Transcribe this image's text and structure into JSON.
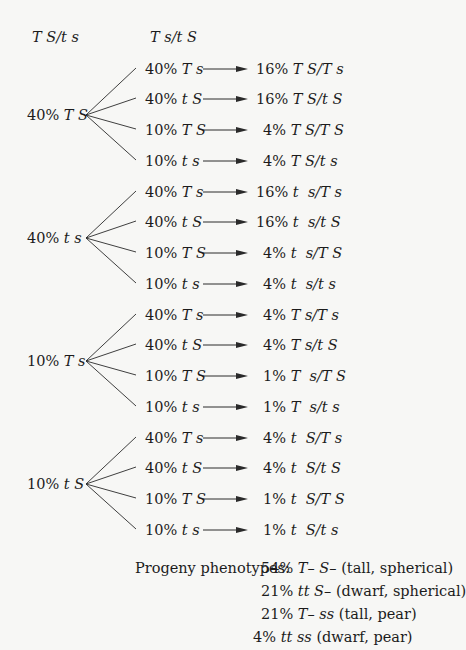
{
  "headers": {
    "parent1": "T S/t s",
    "parent2": "T s/t S"
  },
  "groups": [
    {
      "parent_gamete": "40% T S",
      "parent_y": 115,
      "rows": [
        {
          "gamete": "40% T s",
          "progeny": "16% T S/T s",
          "y": 69
        },
        {
          "gamete": "40% t S",
          "progeny": "16% T S/t S",
          "y": 99
        },
        {
          "gamete": "10% T S",
          "progeny": "4% T S/T S",
          "y": 130
        },
        {
          "gamete": "10% t s",
          "progeny": "4% T S/t s",
          "y": 161
        }
      ]
    },
    {
      "parent_gamete": "40% t s",
      "parent_y": 238,
      "rows": [
        {
          "gamete": "40% T s",
          "progeny": "16% t  s/T s",
          "y": 192
        },
        {
          "gamete": "40% t S",
          "progeny": "16% t  s/t S",
          "y": 222
        },
        {
          "gamete": "10% T S",
          "progeny": "4% t  s/T S",
          "y": 253
        },
        {
          "gamete": "10% t s",
          "progeny": "4% t  s/t s",
          "y": 284
        }
      ]
    },
    {
      "parent_gamete": "10% T s",
      "parent_y": 361,
      "rows": [
        {
          "gamete": "40% T s",
          "progeny": "4% T s/T s",
          "y": 315
        },
        {
          "gamete": "40% t S",
          "progeny": "4% T s/t S",
          "y": 345
        },
        {
          "gamete": "10% T S",
          "progeny": "1% T  s/T S",
          "y": 376
        },
        {
          "gamete": "10% t s",
          "progeny": "1% T  s/t s",
          "y": 407
        }
      ]
    },
    {
      "parent_gamete": "10% t S",
      "parent_y": 484,
      "rows": [
        {
          "gamete": "40% T s",
          "progeny": "4% t  S/T s",
          "y": 438
        },
        {
          "gamete": "40% t S",
          "progeny": "4% t  S/t S",
          "y": 468
        },
        {
          "gamete": "10% T S",
          "progeny": "1% t  S/T S",
          "y": 499
        },
        {
          "gamete": "10% t s",
          "progeny": "1% t  S/t s",
          "y": 530
        }
      ]
    }
  ],
  "summary": {
    "label": "Progeny phenotypes:",
    "lines": [
      {
        "pct": "54%",
        "genotype": "T– S–",
        "desc": "(tall, spherical)"
      },
      {
        "pct": "21%",
        "genotype": "tt S–",
        "desc": "(dwarf, spherical)"
      },
      {
        "pct": "21%",
        "genotype": "T– ss",
        "desc": "(tall, pear)"
      },
      {
        "pct": "4%",
        "genotype": "tt ss",
        "desc": "(dwarf, pear)"
      }
    ]
  },
  "colors": {
    "text": "#1c1c1c",
    "background": "#f7f7f5",
    "lines": "#2a2a2a"
  }
}
